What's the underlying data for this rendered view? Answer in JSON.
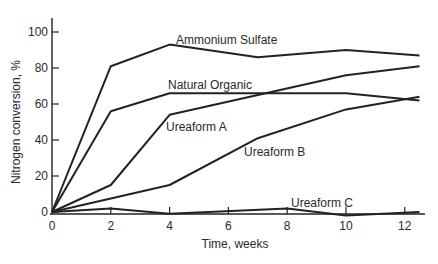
{
  "chart_data": {
    "type": "line",
    "title": "",
    "xlabel": "Time, weeks",
    "ylabel": "Nitrogen conversion, %",
    "xlim": [
      0,
      12.5
    ],
    "ylim": [
      0,
      105
    ],
    "x_ticks": [
      0,
      2,
      4,
      6,
      8,
      10,
      12
    ],
    "y_ticks": [
      0,
      20,
      40,
      60,
      80,
      100
    ],
    "grid": false,
    "legend": "inline labels",
    "series": [
      {
        "name": "Ammonium Sulfate",
        "x": [
          0,
          2,
          4,
          7,
          10,
          12.5
        ],
        "values": [
          0,
          81,
          93,
          86,
          90,
          87
        ]
      },
      {
        "name": "Natural Organic",
        "x": [
          0,
          2,
          4,
          10,
          12.5
        ],
        "values": [
          0,
          56,
          66,
          66,
          62
        ]
      },
      {
        "name": "Ureaform A",
        "x": [
          0,
          2,
          4,
          10,
          12.5
        ],
        "values": [
          0,
          15,
          54,
          76,
          81
        ]
      },
      {
        "name": "Ureaform B",
        "x": [
          0,
          4,
          7,
          10,
          12.5
        ],
        "values": [
          0,
          15,
          41,
          57,
          64
        ]
      },
      {
        "name": "Ureaform C",
        "x": [
          0,
          2,
          4,
          8,
          10,
          12.5
        ],
        "values": [
          0,
          2,
          -1,
          2,
          -2,
          0
        ]
      }
    ]
  },
  "labels": {
    "ammonium_sulfate": "Ammonium Sulfate",
    "natural_organic": "Natural Organic",
    "ureaform_a": "Ureaform A",
    "ureaform_b": "Ureaform B",
    "ureaform_c": "Ureaform C",
    "xlabel": "Time, weeks",
    "ylabel": "Nitrogen conversion, %"
  },
  "colors": {
    "line": "#222222",
    "axis": "#222222",
    "text": "#2a2a2a",
    "background": "#ffffff"
  }
}
